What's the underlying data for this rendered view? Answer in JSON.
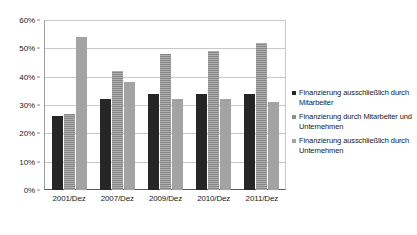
{
  "chart_data": {
    "type": "bar",
    "title": "",
    "subtitle": "",
    "xlabel": "",
    "ylabel": "",
    "categories": [
      "2001/Dez",
      "2007/Dez",
      "2009/Dez",
      "2010/Dez",
      "2011/Dez"
    ],
    "series": [
      {
        "name": "Finanzierung ausschließlich durch Mitarbeiter",
        "color": "#262626",
        "values": [
          26,
          32,
          34,
          34,
          34
        ]
      },
      {
        "name": "Finanzierung durch Mitarbeiter und Unternehmen",
        "color": "#8e8e8e",
        "values": [
          27,
          42,
          48,
          49,
          52
        ]
      },
      {
        "name": "Finanzierung ausschließlich durch Unternehmen",
        "color": "#a3a3a3",
        "values": [
          54,
          38,
          32,
          32,
          31
        ]
      }
    ],
    "ylim": [
      0,
      60
    ],
    "ytick_values": [
      0,
      10,
      20,
      30,
      40,
      50,
      60
    ],
    "ytick_labels": [
      "0%",
      "10%",
      "20%",
      "30%",
      "40%",
      "50%",
      "60%"
    ],
    "grid": true,
    "legend_position": "right"
  }
}
